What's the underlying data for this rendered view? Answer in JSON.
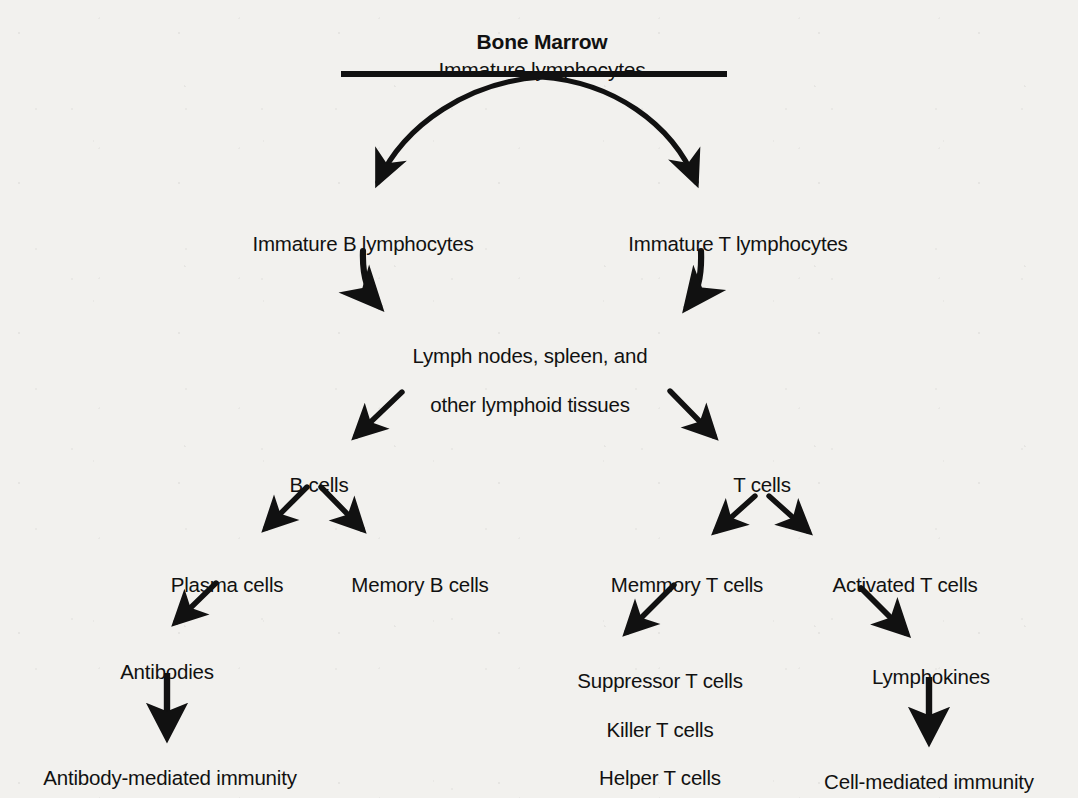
{
  "diagram": {
    "type": "flowchart",
    "title": "Bone Marrow",
    "subtitle": "Immature lymphocytes",
    "background_color": "#f2f1ee",
    "ink_color": "#111111",
    "nodes": {
      "bone_marrow": "Bone Marrow",
      "immature_lymphocytes": "Immature lymphocytes",
      "immature_b": "Immature B lymphocytes",
      "immature_t": "Immature T lymphocytes",
      "lymphoid_tissues_line1": "Lymph nodes, spleen, and",
      "lymphoid_tissues_line2": "other lymphoid tissues",
      "b_cells": "B cells",
      "t_cells": "T cells",
      "plasma_cells": "Plasma cells",
      "memory_b_cells": "Memory B cells",
      "memory_t_cells": "Memmory T cells",
      "activated_t_cells": "Activated T cells",
      "antibodies": "Antibodies",
      "suppressor_t_cells": "Suppressor T cells",
      "killer_t_cells": "Killer T cells",
      "helper_t_cells": "Helper T cells",
      "lymphokines": "Lymphokines",
      "antibody_mediated_immunity": "Antibody-mediated immunity",
      "cell_mediated_immunity": "Cell-mediated immunity"
    },
    "edges": [
      {
        "from": "bone_marrow",
        "to": "immature_b",
        "style": "curved"
      },
      {
        "from": "bone_marrow",
        "to": "immature_t",
        "style": "curved"
      },
      {
        "from": "immature_b",
        "to": "lymphoid_tissues",
        "style": "curved"
      },
      {
        "from": "immature_t",
        "to": "lymphoid_tissues",
        "style": "curved"
      },
      {
        "from": "lymphoid_tissues",
        "to": "b_cells",
        "style": "straight"
      },
      {
        "from": "lymphoid_tissues",
        "to": "t_cells",
        "style": "straight"
      },
      {
        "from": "b_cells",
        "to": "plasma_cells",
        "style": "straight"
      },
      {
        "from": "b_cells",
        "to": "memory_b_cells",
        "style": "straight"
      },
      {
        "from": "t_cells",
        "to": "memory_t_cells",
        "style": "straight"
      },
      {
        "from": "t_cells",
        "to": "activated_t_cells",
        "style": "straight"
      },
      {
        "from": "plasma_cells",
        "to": "antibodies",
        "style": "straight"
      },
      {
        "from": "memory_t_cells",
        "to": "suppressor_t_cells",
        "style": "straight"
      },
      {
        "from": "activated_t_cells",
        "to": "lymphokines",
        "style": "straight"
      },
      {
        "from": "antibodies",
        "to": "antibody_mediated_immunity",
        "style": "vertical"
      },
      {
        "from": "lymphokines",
        "to": "cell_mediated_immunity",
        "style": "vertical"
      }
    ]
  }
}
